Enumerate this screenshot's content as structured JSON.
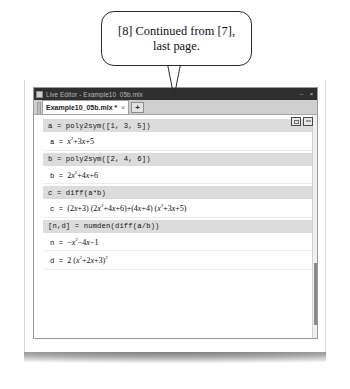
{
  "callout": {
    "text": "[8] Continued from [7], last page."
  },
  "window": {
    "title": "Live Editor - Example10_05b.mlx",
    "icon": "app-icon",
    "minimize_label": "–",
    "close_label": "×"
  },
  "tabs": {
    "document": {
      "label": "Example10_05b.mlx *",
      "close_label": "×"
    },
    "new_tab_label": "+"
  },
  "view_toggles": [
    {
      "name": "output-inline-toggle"
    },
    {
      "name": "output-right-toggle"
    }
  ],
  "cells": [
    {
      "type": "code",
      "text": "a = poly2sym([1, 3, 5])"
    },
    {
      "type": "output",
      "var": "a = ",
      "expr_html": "<i>x</i><sup>2</sup>+3<i>x</i>+5"
    },
    {
      "type": "code",
      "text": "b = poly2sym([2, 4, 6])"
    },
    {
      "type": "output",
      "var": "b = ",
      "expr_html": "2<i>x</i><sup>2</sup>+4<i>x</i>+6"
    },
    {
      "type": "code",
      "text": "c = diff(a*b)"
    },
    {
      "type": "output",
      "var": "c = ",
      "expr_html": "(2<i>x</i>+3) (2<i>x</i><sup>2</sup>+4<i>x</i>+6)+(4<i>x</i>+4) (<i>x</i><sup>2</sup>+3<i>x</i>+5)"
    },
    {
      "type": "code",
      "text": "[n,d] = numden(diff(a/b))"
    },
    {
      "type": "output",
      "var": "n = ",
      "expr_html": "−<i>x</i><sup>2</sup>−4<i>x</i>−1"
    },
    {
      "type": "output",
      "var": "d = ",
      "expr_html": "2 (<i>x</i><sup>2</sup>+2<i>x</i>+3)<sup>2</sup>"
    }
  ],
  "colors": {
    "titlebar": "#2f2f2f",
    "code_cell": "#dcdcdc",
    "tabstrip": "#cfcfcf",
    "scroll_thumb": "#8a8a8a"
  }
}
